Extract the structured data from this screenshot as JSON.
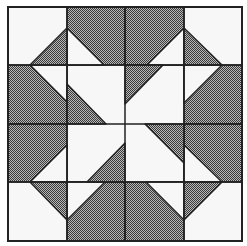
{
  "colors": {
    "background": "#ffffff",
    "light": "#f7f7f7",
    "dark_a": "#3a3a3a",
    "dark_b": "#b8b8b8",
    "line": "#222222"
  },
  "grid": {
    "x": [
      8,
      67,
      125,
      184,
      242
    ],
    "y": [
      7,
      65,
      124,
      182,
      241
    ]
  },
  "dark_cells": [
    {
      "name": "cell-r0-c1",
      "pts": "67,7 125,7 125,65 67,65"
    },
    {
      "name": "cell-r0-c2",
      "pts": "125,7 184,7 184,65 125,65"
    },
    {
      "name": "cell-r1-c0",
      "pts": "8,65 67,65 67,124 8,124"
    },
    {
      "name": "cell-r2-c0",
      "pts": "8,124 67,124 67,182 8,182"
    },
    {
      "name": "cell-r1-c3",
      "pts": "184,65 242,65 242,124 184,124"
    },
    {
      "name": "cell-r2-c3",
      "pts": "184,124 242,124 242,182 184,182"
    },
    {
      "name": "cell-r3-c1",
      "pts": "67,182 125,182 125,241 67,241"
    },
    {
      "name": "cell-r3-c2",
      "pts": "125,182 184,182 184,241 125,241"
    }
  ],
  "light_triangles": [
    {
      "name": "light-tri-r0-c1",
      "pts": "67,28 67,65 104,65"
    },
    {
      "name": "light-tri-r0-c2",
      "pts": "184,28 184,65 147,65"
    },
    {
      "name": "light-tri-r1-c0",
      "pts": "30,65 67,65 67,102"
    },
    {
      "name": "light-tri-r2-c0",
      "pts": "67,145 67,182 30,182"
    },
    {
      "name": "light-tri-r1-c3",
      "pts": "184,65 222,65 184,103"
    },
    {
      "name": "light-tri-r2-c3",
      "pts": "184,145 184,182 222,182"
    },
    {
      "name": "light-tri-r3-c1",
      "pts": "67,182 105,182 67,220"
    },
    {
      "name": "light-tri-r3-c2",
      "pts": "146,182 184,182 184,220"
    }
  ],
  "dark_triangles": [
    {
      "name": "dark-tri-r0-c0",
      "pts": "67,28 30,65 67,65"
    },
    {
      "name": "dark-tri-r0-c3",
      "pts": "184,28 184,65 222,65"
    },
    {
      "name": "dark-tri-r1-c1",
      "pts": "67,84 67,124 106,124"
    },
    {
      "name": "dark-tri-r1-c2",
      "pts": "125,65 163,65 125,104"
    },
    {
      "name": "dark-tri-r2-c1",
      "pts": "125,143 125,182 87,182"
    },
    {
      "name": "dark-tri-r2-c2",
      "pts": "145,124 184,124 184,163"
    },
    {
      "name": "dark-tri-r3-c0",
      "pts": "30,182 67,182 67,220"
    },
    {
      "name": "dark-tri-r3-c3",
      "pts": "184,182 222,182 184,220"
    }
  ]
}
